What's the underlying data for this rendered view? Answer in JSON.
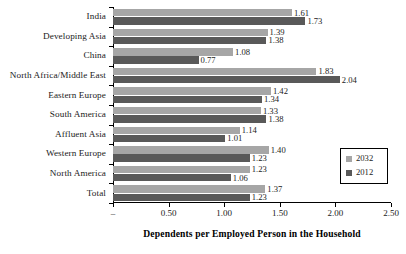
{
  "chart_data": {
    "type": "bar",
    "orientation": "horizontal",
    "title": "",
    "xlabel": "Dependents per Employed Person in the Household",
    "ylabel": "",
    "xlim": [
      0,
      2.5
    ],
    "grid": false,
    "legend_position": "right",
    "categories": [
      "India",
      "Developing Asia",
      "China",
      "North Africa/Middle East",
      "Eastern Europe",
      "South America",
      "Affluent Asia",
      "Western Europe",
      "North America",
      "Total"
    ],
    "series": [
      {
        "name": "2032",
        "color": "#a6a6a6",
        "values": [
          1.61,
          1.39,
          1.08,
          1.83,
          1.42,
          1.33,
          1.14,
          1.4,
          1.23,
          1.37
        ]
      },
      {
        "name": "2012",
        "color": "#595959",
        "values": [
          1.73,
          1.38,
          0.77,
          2.04,
          1.34,
          1.38,
          1.01,
          1.23,
          1.06,
          1.23
        ]
      }
    ],
    "xticks": [
      0,
      0.5,
      1.0,
      1.5,
      2.0,
      2.5
    ],
    "xticklabels": [
      "–",
      "0.50",
      "1.00",
      "1.50",
      "2.00",
      "2.50"
    ]
  },
  "legend": {
    "entries": [
      {
        "label": "2032",
        "color": "#a6a6a6"
      },
      {
        "label": "2012",
        "color": "#595959"
      }
    ]
  }
}
